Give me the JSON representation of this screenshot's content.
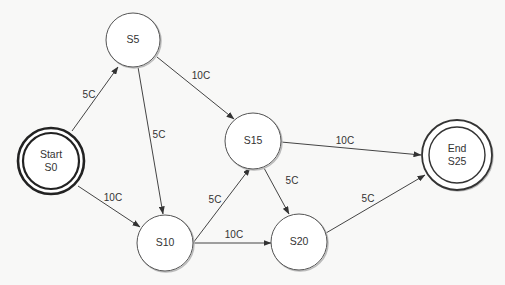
{
  "diagram": {
    "type": "state-machine",
    "states": [
      {
        "id": "S0",
        "lines": [
          "Start",
          "S0"
        ],
        "kind": "start",
        "x": 51,
        "y": 161,
        "r": 28
      },
      {
        "id": "S5",
        "lines": [
          "S5"
        ],
        "kind": "normal",
        "x": 133,
        "y": 40,
        "r": 27
      },
      {
        "id": "S10",
        "lines": [
          "S10"
        ],
        "kind": "normal",
        "x": 165,
        "y": 243,
        "r": 28
      },
      {
        "id": "S15",
        "lines": [
          "S15"
        ],
        "kind": "normal",
        "x": 253,
        "y": 141,
        "r": 28
      },
      {
        "id": "S20",
        "lines": [
          "S20"
        ],
        "kind": "normal",
        "x": 299,
        "y": 242,
        "r": 28
      },
      {
        "id": "S25",
        "lines": [
          "End",
          "S25"
        ],
        "kind": "end",
        "x": 457,
        "y": 155,
        "r": 28
      }
    ],
    "transitions": [
      {
        "from": "S0",
        "to": "S5",
        "label": "5C",
        "lx": 89,
        "ly": 95
      },
      {
        "from": "S0",
        "to": "S10",
        "label": "10C",
        "lx": 113,
        "ly": 198
      },
      {
        "from": "S5",
        "to": "S10",
        "label": "5C",
        "lx": 159,
        "ly": 135
      },
      {
        "from": "S5",
        "to": "S15",
        "label": "10C",
        "lx": 200,
        "ly": 75
      },
      {
        "from": "S10",
        "to": "S15",
        "label": "5C",
        "lx": 215,
        "ly": 200
      },
      {
        "from": "S10",
        "to": "S20",
        "label": "10C",
        "lx": 233,
        "ly": 235
      },
      {
        "from": "S15",
        "to": "S20",
        "label": "5C",
        "lx": 292,
        "ly": 180
      },
      {
        "from": "S15",
        "to": "S25",
        "label": "10C",
        "lx": 345,
        "ly": 140
      },
      {
        "from": "S20",
        "to": "S25",
        "label": "5C",
        "lx": 368,
        "ly": 199
      }
    ]
  },
  "labels": {
    "s0_line1": "Start",
    "s0_line2": "S0",
    "s5": "S5",
    "s10": "S10",
    "s15": "S15",
    "s20": "S20",
    "s25_line1": "End",
    "s25_line2": "S25",
    "e_s0_s5": "5C",
    "e_s0_s10": "10C",
    "e_s5_s10": "5C",
    "e_s5_s15": "10C",
    "e_s10_s15": "5C",
    "e_s10_s20": "10C",
    "e_s15_s20": "5C",
    "e_s15_s25": "10C",
    "e_s20_s25": "5C"
  },
  "colors": {
    "background": "#f8f8f7",
    "stroke": "#444444",
    "text": "#333333"
  }
}
